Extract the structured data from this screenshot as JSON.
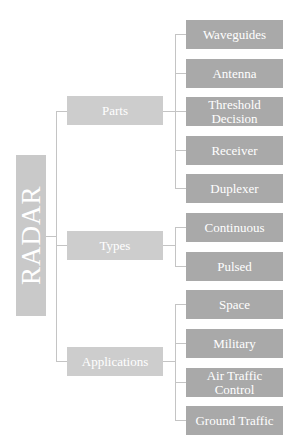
{
  "diagram": {
    "root": {
      "label": "RADAR"
    },
    "branches": [
      {
        "label": "Parts",
        "children": [
          "Waveguides",
          "Antenna",
          "Threshold Decision",
          "Receiver",
          "Duplexer"
        ]
      },
      {
        "label": "Types",
        "children": [
          "Continuous",
          "Pulsed"
        ]
      },
      {
        "label": "Applications",
        "children": [
          "Space",
          "Military",
          "Air Traffic Control",
          "Ground Traffic"
        ]
      }
    ]
  },
  "colors": {
    "root_fill": "#c9c9c9",
    "branch_fill": "#cdcdcd",
    "leaf_fill": "#a9a9a9",
    "connector": "#c4c4c4",
    "text": "#ffffff"
  }
}
